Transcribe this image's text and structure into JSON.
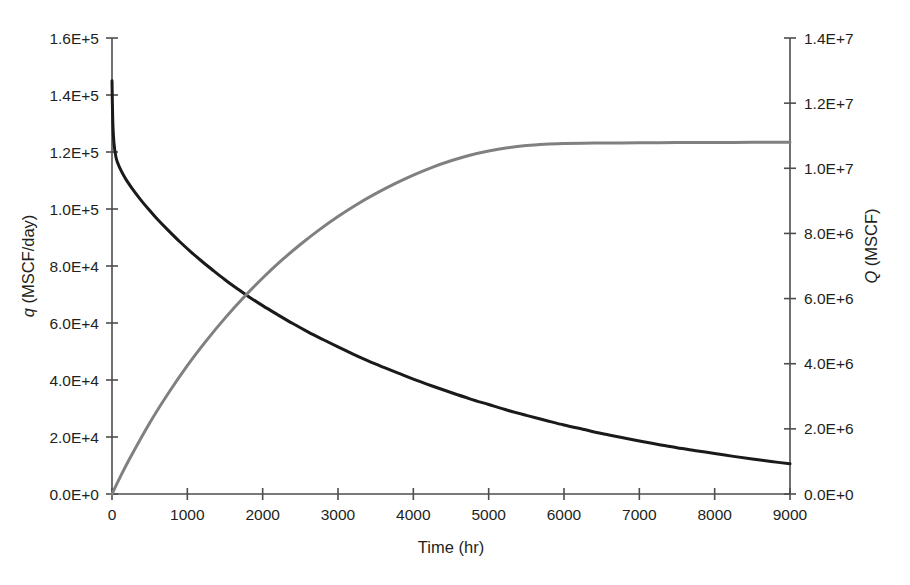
{
  "chart_data": {
    "type": "line",
    "title": "",
    "subtitle": "",
    "xlabel": "Time (hr)",
    "ylabel": "q (MSCF/day)",
    "ylabel_symbol": "q",
    "ylabel_rest": " (MSCF/day)",
    "y2label": "Q (MSCF)",
    "y2label_symbol": "Q",
    "y2label_rest": " (MSCF)",
    "grid": false,
    "legend": "none",
    "xlim": [
      0,
      9000
    ],
    "ylim": [
      0,
      160000
    ],
    "y2lim": [
      0,
      14000000
    ],
    "x_ticks": [
      0,
      1000,
      2000,
      3000,
      4000,
      5000,
      6000,
      7000,
      8000,
      9000
    ],
    "x_tick_labels": [
      "0",
      "1000",
      "2000",
      "3000",
      "4000",
      "5000",
      "6000",
      "7000",
      "8000",
      "9000"
    ],
    "y_ticks": [
      0,
      20000,
      40000,
      60000,
      80000,
      100000,
      120000,
      140000,
      160000
    ],
    "y_tick_labels": [
      "0.0E+0",
      "2.0E+4",
      "4.0E+4",
      "6.0E+4",
      "8.0E+4",
      "1.0E+5",
      "1.2E+5",
      "1.4E+5",
      "1.6E+5"
    ],
    "y2_ticks": [
      0,
      2000000,
      4000000,
      6000000,
      8000000,
      10000000,
      12000000,
      14000000
    ],
    "y2_tick_labels": [
      "0.0E+0",
      "2.0E+6",
      "4.0E+6",
      "6.0E+6",
      "8.0E+6",
      "1.0E+7",
      "1.2E+7",
      "1.4E+7"
    ],
    "series": [
      {
        "name": "q (MSCF/day)",
        "axis": "left",
        "color": "#1a1a1a",
        "width": 3.0,
        "x": [
          0,
          10,
          25,
          50,
          75,
          100,
          150,
          200,
          300,
          400,
          500,
          600,
          750,
          900,
          1050,
          1200,
          1350,
          1500,
          1650,
          1800,
          2000,
          2200,
          2400,
          2600,
          2800,
          3000,
          3200,
          3400,
          3600,
          3800,
          4000,
          4250,
          4500,
          4750,
          5000,
          5250,
          5500,
          5750,
          6000,
          6250,
          6500,
          6750,
          7000,
          7250,
          7500,
          7750,
          8000,
          8250,
          8500,
          8750,
          9000
        ],
        "y": [
          145000,
          131000,
          123500,
          118500,
          116200,
          114600,
          112000,
          109800,
          106000,
          102600,
          99500,
          96500,
          92400,
          88500,
          84900,
          81500,
          78300,
          75200,
          72300,
          69500,
          66100,
          62900,
          59800,
          56900,
          54200,
          51600,
          49100,
          46700,
          44500,
          42400,
          40300,
          37900,
          35600,
          33400,
          31400,
          29400,
          27600,
          25900,
          24200,
          22700,
          21200,
          19900,
          18600,
          17400,
          16200,
          15200,
          14200,
          13200,
          12300,
          11400,
          10600
        ]
      },
      {
        "name": "Q (MSCF)",
        "axis": "right",
        "color": "#808080",
        "width": 3.0,
        "x": [
          0,
          100,
          250,
          500,
          750,
          1000,
          1250,
          1500,
          1750,
          2000,
          2250,
          2500,
          2750,
          3000,
          3250,
          3500,
          3750,
          4000,
          4250,
          4500,
          4750,
          5000,
          5250,
          5500,
          5750,
          6000,
          6250,
          6500,
          6750,
          7000,
          7250,
          7500,
          7750,
          8000,
          8250,
          8500,
          8750,
          9000
        ],
        "y": [
          0,
          480000,
          1150000,
          2180000,
          3100000,
          3940000,
          4700000,
          5400000,
          6040000,
          6630000,
          7170000,
          7660000,
          8110000,
          8520000,
          8890000,
          9220000,
          9520000,
          9790000,
          10030000,
          10230000,
          10400000,
          10530000,
          10630000,
          10700000,
          10740000,
          10760000,
          10770000,
          10775000,
          10780000,
          10783000,
          10786000,
          10789000,
          10791000,
          10793000,
          10795000,
          10797000,
          10799000,
          10800000
        ]
      }
    ],
    "annotations": []
  },
  "layout": {
    "plot_left": 112,
    "plot_right": 790,
    "plot_top": 38,
    "plot_bottom": 494,
    "axis_color": "#4d4d4d"
  }
}
